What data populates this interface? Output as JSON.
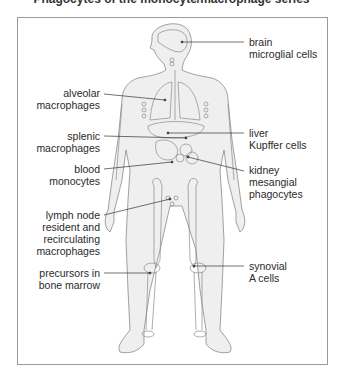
{
  "title": "Phagocytes of the monocyte/macrophage series",
  "labels": {
    "brain": [
      "brain",
      "microglial cells"
    ],
    "alveolar": [
      "alveolar",
      "macrophages"
    ],
    "splenic": [
      "splenic",
      "macrophages"
    ],
    "blood": [
      "blood",
      "monocytes"
    ],
    "lymph": [
      "lymph node",
      "resident and",
      "recirculating",
      "macrophages"
    ],
    "marrow": [
      "precursors in",
      "bone marrow"
    ],
    "liver": [
      "liver",
      "Kupffer cells"
    ],
    "kidney": [
      "kidney",
      "mesangial",
      "phagocytes"
    ],
    "synovial": [
      "synovial",
      "A cells"
    ]
  },
  "colors": {
    "body_fill": "#efefef",
    "outline": "#8a8a8a",
    "leader": "#333333",
    "frame": "#9a9a9a"
  }
}
